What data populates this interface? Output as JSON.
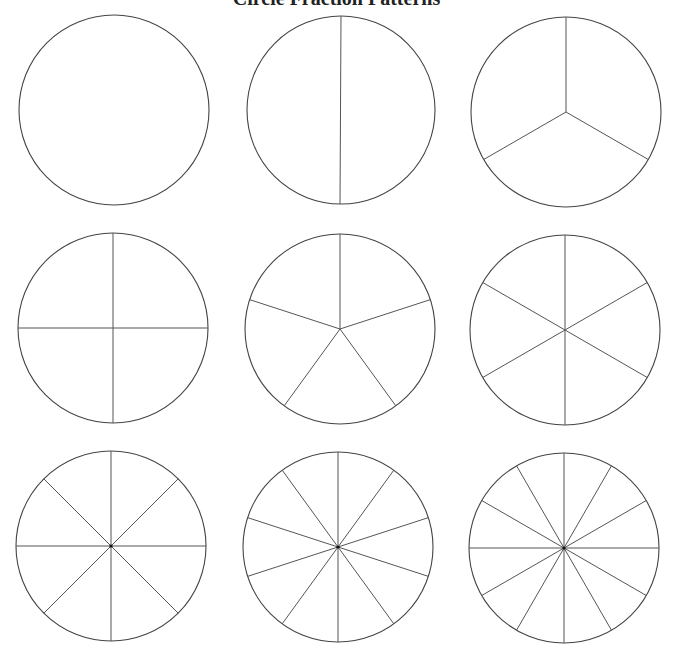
{
  "title": "Circle Fraction Patterns",
  "stroke_color": "#444444",
  "circles": [
    {
      "name": "whole",
      "slices": 1,
      "cx": 114,
      "cy": 110,
      "r": 95
    },
    {
      "name": "halves",
      "slices": 2,
      "cx": 341,
      "cy": 110,
      "r": 94
    },
    {
      "name": "thirds",
      "slices": 3,
      "cx": 566,
      "cy": 112,
      "r": 95
    },
    {
      "name": "fourths",
      "slices": 4,
      "cx": 113,
      "cy": 328,
      "r": 95
    },
    {
      "name": "fifths",
      "slices": 5,
      "cx": 340,
      "cy": 329,
      "r": 95
    },
    {
      "name": "sixths",
      "slices": 6,
      "cx": 565,
      "cy": 330,
      "r": 95
    },
    {
      "name": "eighths",
      "slices": 8,
      "cx": 111,
      "cy": 546,
      "r": 95
    },
    {
      "name": "tenths",
      "slices": 10,
      "cx": 338,
      "cy": 547,
      "r": 95
    },
    {
      "name": "twelfths",
      "slices": 12,
      "cx": 564,
      "cy": 548,
      "r": 95
    }
  ]
}
